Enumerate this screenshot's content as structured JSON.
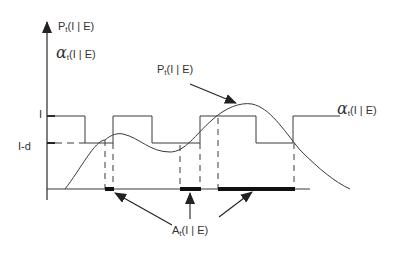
{
  "diagram": {
    "y_axis_labels": {
      "p_symbol": "P",
      "p_sub": "t",
      "p_args": "(I | E)",
      "alpha_symbol": "α",
      "alpha_sub": "t",
      "alpha_args": "(I | E)"
    },
    "level_labels": {
      "upper": "I",
      "lower": "I-d"
    },
    "curve_label": {
      "symbol": "P",
      "sub": "t",
      "args": "(I | E)"
    },
    "step_label": {
      "symbol": "α",
      "sub": "t",
      "args": "(I | E)"
    },
    "region_label": {
      "symbol": "A",
      "sub": "t",
      "args": "(I | E)"
    },
    "colors": {
      "line": "#3a3a3a",
      "text": "#333333",
      "background": "#ffffff"
    }
  }
}
